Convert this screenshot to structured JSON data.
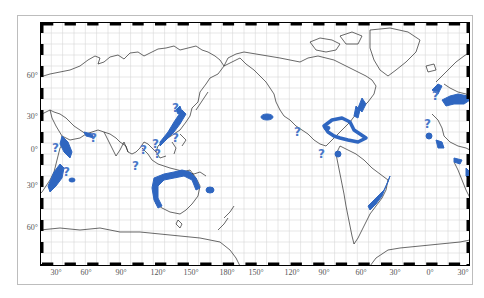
{
  "figure": {
    "caption_fragment": "",
    "colors": {
      "habitat": "#2f66c0",
      "question": "#4a78c8",
      "coast": "#2a2a2a",
      "grid": "#d6d6d6",
      "frame": "#000000"
    }
  },
  "axes": {
    "latitude_labels": [
      {
        "label": "60°",
        "y": 75
      },
      {
        "label": "30°",
        "y": 116
      },
      {
        "label": "0°",
        "y": 149
      },
      {
        "label": "30°",
        "y": 185
      },
      {
        "label": "60°",
        "y": 227
      }
    ],
    "longitude_labels": [
      {
        "label": "30°",
        "x": 56
      },
      {
        "label": "60°",
        "x": 86
      },
      {
        "label": "90°",
        "x": 121
      },
      {
        "label": "120°",
        "x": 158
      },
      {
        "label": "150°",
        "x": 191
      },
      {
        "label": "180°",
        "x": 227
      },
      {
        "label": "150°",
        "x": 256
      },
      {
        "label": "120°",
        "x": 292
      },
      {
        "label": "90°",
        "x": 324
      },
      {
        "label": "60°",
        "x": 361
      },
      {
        "label": "30°",
        "x": 395
      },
      {
        "label": "0°",
        "x": 430
      },
      {
        "label": "30°",
        "x": 463
      }
    ]
  },
  "legend": {
    "question_mark": "?"
  }
}
